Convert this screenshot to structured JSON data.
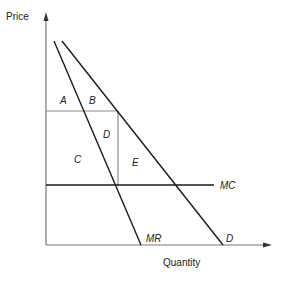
{
  "diagram": {
    "type": "monopoly-deadweight-loss",
    "axes": {
      "y_label": "Price",
      "x_label": "Quantity"
    },
    "curves": {
      "mr_label": "MR",
      "demand_label": "D",
      "mc_label": "MC"
    },
    "regions": {
      "a": "A",
      "b": "B",
      "c": "C",
      "d": "D",
      "e": "E"
    },
    "colors": {
      "curve": "#1a1a1a",
      "guide": "#8a8a8a",
      "text": "#222222"
    }
  }
}
